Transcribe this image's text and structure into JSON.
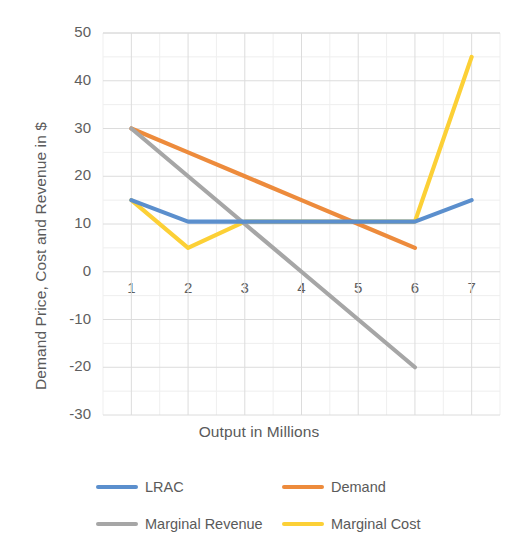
{
  "chart_data": {
    "type": "line",
    "title": "",
    "xlabel": "Output in Millions",
    "ylabel": "Demand Price, Cost and Revenue in $",
    "xlim": [
      0.5,
      7.5
    ],
    "ylim": [
      -30,
      50
    ],
    "grid": true,
    "minor_grid": true,
    "legend_position": "bottom",
    "x_ticks": [
      "1",
      "2",
      "3",
      "4",
      "5",
      "6",
      "7"
    ],
    "y_ticks": [
      "50",
      "40",
      "30",
      "20",
      "10",
      "0",
      "-10",
      "-20",
      "-30"
    ],
    "categories": [
      1,
      2,
      3,
      4,
      5,
      6,
      7
    ],
    "series": [
      {
        "name": "LRAC",
        "color": "#5b8fcd",
        "x": [
          1,
          2,
          3,
          4,
          5,
          6,
          7
        ],
        "values": [
          15,
          10.5,
          10.5,
          10.5,
          10.5,
          10.5,
          15
        ]
      },
      {
        "name": "Demand",
        "color": "#ed8b3c",
        "x": [
          1,
          2,
          3,
          4,
          5,
          6
        ],
        "values": [
          30,
          25,
          20,
          15,
          10,
          5
        ]
      },
      {
        "name": "Marginal Revenue",
        "color": "#a6a6a6",
        "x": [
          1,
          2,
          3,
          4,
          5,
          6
        ],
        "values": [
          30,
          20,
          10,
          0,
          -10,
          -20
        ]
      },
      {
        "name": "Marginal Cost",
        "color": "#fcd036",
        "x": [
          1,
          2,
          3,
          4,
          5,
          6,
          7
        ],
        "values": [
          15,
          5,
          10.5,
          10.5,
          10.5,
          10.5,
          45
        ]
      }
    ]
  },
  "legend": {
    "items": [
      {
        "label": "LRAC",
        "color": "#5b8fcd"
      },
      {
        "label": "Demand",
        "color": "#ed8b3c"
      },
      {
        "label": "Marginal Revenue",
        "color": "#a6a6a6"
      },
      {
        "label": "Marginal Cost",
        "color": "#fcd036"
      }
    ]
  }
}
